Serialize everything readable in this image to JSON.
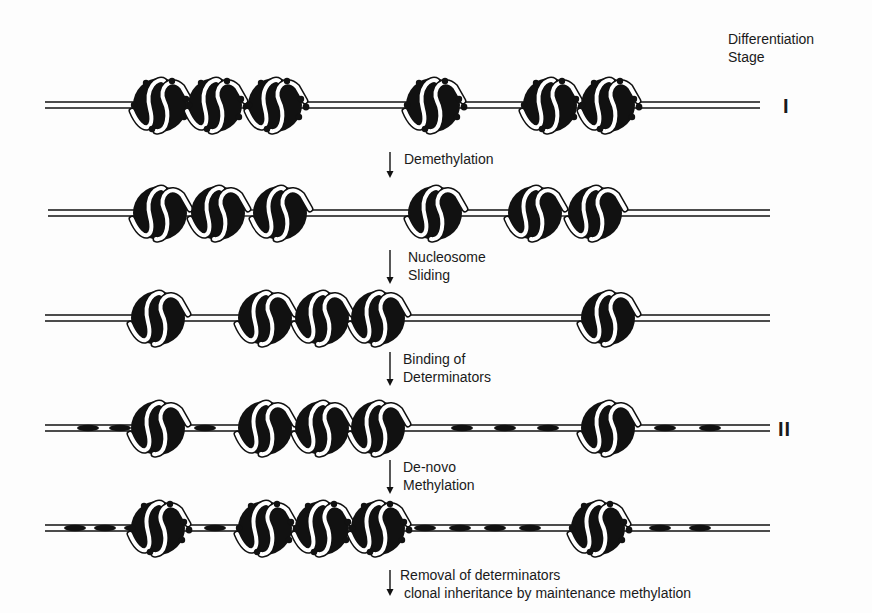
{
  "header": {
    "stage_title_line1": "Differentiation",
    "stage_title_line2": "Stage"
  },
  "stage_markers": [
    {
      "label": "I",
      "row": 0
    },
    {
      "label": "II",
      "row": 3
    }
  ],
  "rows": [
    {
      "id": "row-1",
      "y": 105,
      "x_start": 45,
      "x_end": 760,
      "methylated": true,
      "nucleosomes": [
        160,
        215,
        275,
        433,
        550,
        608
      ],
      "determinators": []
    },
    {
      "id": "row-2",
      "y": 213,
      "x_start": 48,
      "x_end": 770,
      "methylated": false,
      "nucleosomes": [
        160,
        218,
        280,
        435,
        535,
        595
      ],
      "determinators": []
    },
    {
      "id": "row-3",
      "y": 318,
      "x_start": 45,
      "x_end": 770,
      "methylated": false,
      "nucleosomes": [
        158,
        265,
        322,
        378,
        608
      ],
      "determinators": []
    },
    {
      "id": "row-4",
      "y": 428,
      "x_start": 45,
      "x_end": 770,
      "methylated": false,
      "nucleosomes": [
        158,
        265,
        322,
        378,
        608
      ],
      "determinators": [
        88,
        120,
        205,
        462,
        505,
        548,
        665,
        710
      ]
    },
    {
      "id": "row-5",
      "y": 528,
      "x_start": 45,
      "x_end": 770,
      "methylated": true,
      "nucleosomes": [
        158,
        265,
        322,
        378,
        598
      ],
      "determinators": [
        75,
        105,
        135,
        215,
        425,
        460,
        495,
        530,
        660,
        700
      ]
    }
  ],
  "steps": [
    {
      "label": "Demethylation",
      "x": 390,
      "y": 150
    },
    {
      "label": "Nucleosome\nSliding",
      "x": 390,
      "y": 248
    },
    {
      "label": "Binding of\nDeterminators",
      "x": 390,
      "y": 350
    },
    {
      "label": "De-novo\nMethylation",
      "x": 390,
      "y": 458
    },
    {
      "label": "Removal of determinators\n clonal inheritance by maintenance methylation",
      "x": 390,
      "y": 568
    }
  ],
  "colors": {
    "ink": "#111111",
    "background": "#fdfdfd"
  }
}
